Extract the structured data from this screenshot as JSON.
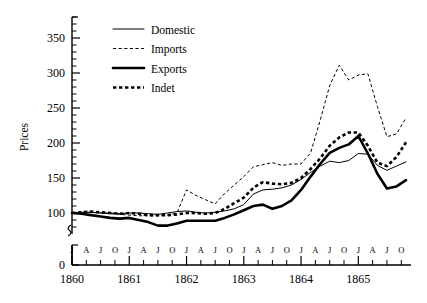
{
  "chart_data": {
    "type": "line",
    "title": "",
    "xlabel": "",
    "ylabel": "Prices",
    "ylim": [
      70,
      380
    ],
    "xlim": [
      1860.0,
      1865.92
    ],
    "grid": false,
    "legend_position": "top-left",
    "y_ticks_major": [
      100,
      150,
      200,
      250,
      300,
      350
    ],
    "y_ticks_minor_step": 10,
    "y_axis_break": true,
    "y_axis_break_label": "0",
    "x_year_labels": [
      "1860",
      "1861",
      "1862",
      "1863",
      "1864",
      "1865"
    ],
    "x_month_labels": [
      "J",
      "A",
      "J",
      "O",
      "J",
      "A",
      "J",
      "O",
      "J",
      "A",
      "J",
      "O",
      "J",
      "A",
      "J",
      "O",
      "J",
      "A",
      "J",
      "O",
      "J",
      "A",
      "J",
      "O"
    ],
    "x_month_label_values": [
      1860.0,
      1860.25,
      1860.5,
      1860.75,
      1861.0,
      1861.25,
      1861.5,
      1861.75,
      1862.0,
      1862.25,
      1862.5,
      1862.75,
      1863.0,
      1863.25,
      1863.5,
      1863.75,
      1864.0,
      1864.25,
      1864.5,
      1864.75,
      1865.0,
      1865.25,
      1865.5,
      1865.75
    ],
    "x": [
      1860.0,
      1860.167,
      1860.333,
      1860.5,
      1860.667,
      1860.833,
      1861.0,
      1861.167,
      1861.333,
      1861.5,
      1861.667,
      1861.833,
      1862.0,
      1862.167,
      1862.333,
      1862.5,
      1862.667,
      1862.833,
      1863.0,
      1863.167,
      1863.333,
      1863.5,
      1863.667,
      1863.833,
      1864.0,
      1864.167,
      1864.333,
      1864.5,
      1864.667,
      1864.833,
      1865.0,
      1865.167,
      1865.333,
      1865.5,
      1865.667,
      1865.833
    ],
    "series": [
      {
        "name": "Domestic",
        "style": "thin-solid",
        "values": [
          100,
          101,
          101,
          100,
          100,
          99,
          100,
          100,
          99,
          98,
          100,
          102,
          103,
          101,
          100,
          101,
          103,
          106,
          112,
          127,
          133,
          134,
          136,
          140,
          148,
          158,
          167,
          174,
          172,
          175,
          185,
          184,
          168,
          161,
          167,
          173
        ]
      },
      {
        "name": "Imports",
        "style": "thin-dashed",
        "values": [
          100,
          101,
          101,
          100,
          99,
          98,
          97,
          96,
          96,
          96,
          97,
          100,
          133,
          125,
          119,
          113,
          128,
          140,
          152,
          166,
          169,
          172,
          168,
          170,
          170,
          186,
          232,
          282,
          311,
          290,
          297,
          299,
          252,
          209,
          213,
          236
        ]
      },
      {
        "name": "Exports",
        "style": "thick-solid",
        "values": [
          100,
          99,
          97,
          95,
          93,
          92,
          93,
          90,
          87,
          82,
          82,
          85,
          89,
          89,
          89,
          89,
          93,
          98,
          104,
          110,
          112,
          106,
          110,
          118,
          133,
          152,
          170,
          186,
          193,
          198,
          210,
          185,
          156,
          135,
          138,
          147
        ]
      },
      {
        "name": "Indet",
        "style": "thick-dashed",
        "values": [
          100,
          101,
          102,
          101,
          100,
          99,
          100,
          99,
          97,
          97,
          97,
          98,
          100,
          100,
          99,
          100,
          106,
          114,
          122,
          136,
          144,
          142,
          141,
          143,
          150,
          163,
          178,
          196,
          208,
          215,
          215,
          196,
          172,
          167,
          180,
          201
        ]
      }
    ],
    "legend_entries": [
      {
        "label": "Domestic",
        "style": "thin-solid"
      },
      {
        "label": "Imports",
        "style": "thin-dashed"
      },
      {
        "label": "Exports",
        "style": "thick-solid"
      },
      {
        "label": "Indet",
        "style": "thick-dashed"
      }
    ]
  }
}
